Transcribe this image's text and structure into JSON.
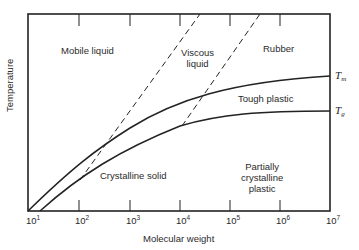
{
  "diagram": {
    "type": "phase-diagram",
    "xlabel": "Molecular weight",
    "ylabel": "Temperature",
    "x_ticks": [
      {
        "base": "10",
        "exp": "1"
      },
      {
        "base": "10",
        "exp": "2"
      },
      {
        "base": "10",
        "exp": "3"
      },
      {
        "base": "10",
        "exp": "4"
      },
      {
        "base": "10",
        "exp": "5"
      },
      {
        "base": "10",
        "exp": "6"
      },
      {
        "base": "10",
        "exp": "7"
      }
    ],
    "curves": {
      "tm": {
        "symbol": "T",
        "subscript": "m"
      },
      "tg": {
        "symbol": "T",
        "subscript": "g"
      }
    },
    "regions": {
      "mobile_liquid": "Mobile liquid",
      "viscous_liquid_line1": "Viscous",
      "viscous_liquid_line2": "liquid",
      "rubber": "Rubber",
      "tough_plastic": "Tough plastic",
      "crystalline_solid": "Crystalline solid",
      "partially_line1": "Partially",
      "partially_line2": "crystalline",
      "partially_line3": "plastic"
    }
  }
}
